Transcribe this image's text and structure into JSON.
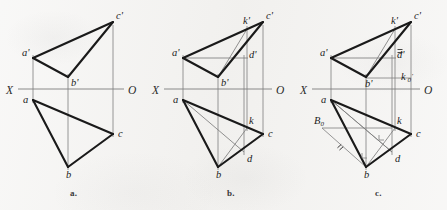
{
  "figure": {
    "background_color": "#f2f1ef",
    "ink_color": "#1a1a1a",
    "thin_color": "#7d7d7d"
  },
  "panels": [
    {
      "id": "a",
      "caption": "a.",
      "caption_x": 70,
      "caption_y": 192,
      "axis": {
        "x_label": "X",
        "o_label": "O",
        "x_label_pos": [
          6,
          94
        ],
        "o_label_pos": [
          128,
          94
        ],
        "line": [
          18,
          89,
          124,
          89
        ]
      },
      "points": [
        {
          "name": "a'",
          "x": 33,
          "y": 58,
          "label_dx": -11,
          "label_dy": -2
        },
        {
          "name": "b'",
          "x": 68,
          "y": 77,
          "label_dx": 3,
          "label_dy": 9
        },
        {
          "name": "c'",
          "x": 113,
          "y": 22,
          "label_dx": 3,
          "label_dy": -3
        },
        {
          "name": "a",
          "x": 33,
          "y": 100,
          "label_dx": -10,
          "label_dy": 3
        },
        {
          "name": "b",
          "x": 68,
          "y": 167,
          "label_dx": -2,
          "label_dy": 11
        },
        {
          "name": "c",
          "x": 113,
          "y": 134,
          "label_dx": 5,
          "label_dy": 3
        }
      ],
      "thick_edges": [
        [
          "a'",
          "b'"
        ],
        [
          "b'",
          "c'"
        ],
        [
          "c'",
          "a'"
        ],
        [
          "a",
          "b"
        ],
        [
          "b",
          "c"
        ],
        [
          "c",
          "a"
        ]
      ],
      "projection_lines": [
        [
          33,
          55,
          33,
          103
        ],
        [
          68,
          74,
          68,
          170
        ],
        [
          113,
          25,
          113,
          137
        ]
      ],
      "thin_edges": [],
      "extras": []
    },
    {
      "id": "b",
      "caption": "b.",
      "caption_x": 227,
      "caption_y": 192,
      "axis": {
        "x_label": "X",
        "o_label": "O",
        "x_label_pos": [
          152,
          94
        ],
        "o_label_pos": [
          276,
          94
        ],
        "line": [
          164,
          89,
          272,
          89
        ]
      },
      "points": [
        {
          "name": "a'",
          "x": 183,
          "y": 58,
          "label_dx": -11,
          "label_dy": -2
        },
        {
          "name": "b'",
          "x": 218,
          "y": 77,
          "label_dx": 3,
          "label_dy": 9
        },
        {
          "name": "c'",
          "x": 263,
          "y": 22,
          "label_dx": 3,
          "label_dy": -3
        },
        {
          "name": "k'",
          "x": 247,
          "y": 29,
          "label_dx": -4,
          "label_dy": -5
        },
        {
          "name": "d'",
          "x": 248,
          "y": 58,
          "label_dx": 1,
          "label_dy": 0
        },
        {
          "name": "a",
          "x": 183,
          "y": 100,
          "label_dx": -10,
          "label_dy": 3
        },
        {
          "name": "b",
          "x": 218,
          "y": 167,
          "label_dx": -2,
          "label_dy": 11
        },
        {
          "name": "c",
          "x": 263,
          "y": 134,
          "label_dx": 5,
          "label_dy": 3
        },
        {
          "name": "k",
          "x": 247,
          "y": 128,
          "label_dx": 2,
          "label_dy": -4
        },
        {
          "name": "d",
          "x": 244,
          "y": 152,
          "label_dx": 3,
          "label_dy": 10
        }
      ],
      "thick_edges": [
        [
          "a'",
          "b'"
        ],
        [
          "b'",
          "c'"
        ],
        [
          "c'",
          "a'"
        ],
        [
          "a",
          "b"
        ],
        [
          "b",
          "c"
        ],
        [
          "c",
          "a"
        ]
      ],
      "thin_edges": [
        [
          "a'",
          "d'"
        ],
        [
          "b'",
          "k'"
        ],
        [
          "a",
          "d"
        ],
        [
          "b",
          "k"
        ]
      ],
      "projection_lines": [
        [
          183,
          55,
          183,
          103
        ],
        [
          218,
          74,
          218,
          170
        ],
        [
          263,
          25,
          263,
          137
        ],
        [
          247,
          26,
          247,
          131
        ],
        [
          244,
          55,
          244,
          155
        ]
      ],
      "extras": []
    },
    {
      "id": "c",
      "caption": "c.",
      "caption_x": 375,
      "caption_y": 192,
      "axis": {
        "x_label": "X",
        "o_label": "O",
        "x_label_pos": [
          300,
          94
        ],
        "o_label_pos": [
          424,
          94
        ],
        "line": [
          312,
          89,
          420,
          89
        ]
      },
      "points": [
        {
          "name": "a'",
          "x": 331,
          "y": 58,
          "label_dx": -11,
          "label_dy": -2
        },
        {
          "name": "b'",
          "x": 366,
          "y": 77,
          "label_dx": -1,
          "label_dy": 10
        },
        {
          "name": "c'",
          "x": 411,
          "y": 22,
          "label_dx": 3,
          "label_dy": -3
        },
        {
          "name": "k'",
          "x": 395,
          "y": 29,
          "label_dx": -4,
          "label_dy": -5
        },
        {
          "name": "d'",
          "x": 396,
          "y": 58,
          "label_dx": 1,
          "label_dy": 0
        },
        {
          "name": "a",
          "x": 331,
          "y": 100,
          "label_dx": -10,
          "label_dy": 3
        },
        {
          "name": "b",
          "x": 366,
          "y": 167,
          "label_dx": -2,
          "label_dy": 11
        },
        {
          "name": "c",
          "x": 411,
          "y": 134,
          "label_dx": 5,
          "label_dy": 3
        },
        {
          "name": "k",
          "x": 395,
          "y": 128,
          "label_dx": 2,
          "label_dy": -4
        },
        {
          "name": "d",
          "x": 392,
          "y": 152,
          "label_dx": 3,
          "label_dy": 10
        }
      ],
      "thick_edges": [
        [
          "a'",
          "b'"
        ],
        [
          "b'",
          "c'"
        ],
        [
          "c'",
          "a'"
        ],
        [
          "a",
          "b"
        ],
        [
          "b",
          "c"
        ],
        [
          "c",
          "a"
        ]
      ],
      "thin_edges": [
        [
          "a'",
          "d'"
        ],
        [
          "b'",
          "k'"
        ],
        [
          "a",
          "d"
        ],
        [
          "b",
          "k"
        ]
      ],
      "projection_lines": [
        [
          331,
          55,
          331,
          103
        ],
        [
          366,
          74,
          366,
          170
        ],
        [
          411,
          25,
          411,
          137
        ],
        [
          395,
          26,
          395,
          131
        ],
        [
          392,
          55,
          392,
          155
        ]
      ],
      "extras": [
        {
          "kind": "label",
          "name": "k0-prime",
          "text": "k",
          "sub": "0",
          "prime": true,
          "x": 401,
          "y": 80
        },
        {
          "kind": "label",
          "name": "b0",
          "text": "B",
          "sub": "0",
          "prime": false,
          "x": 314,
          "y": 124
        },
        {
          "kind": "line",
          "name": "k0-horizontal",
          "coords": [
            366,
            78,
            411,
            78
          ]
        },
        {
          "kind": "line",
          "name": "b0-horizontal",
          "coords": [
            322,
            128,
            392,
            128
          ]
        },
        {
          "kind": "line",
          "name": "b0-to-b",
          "coords": [
            322,
            128,
            366,
            167
          ]
        },
        {
          "kind": "line",
          "name": "a-to-d-extend",
          "coords": [
            331,
            100,
            392,
            152
          ]
        },
        {
          "kind": "tick",
          "name": "tick-d-prime",
          "x": 400,
          "y": 52,
          "angle": 0
        },
        {
          "kind": "tick",
          "name": "tick-b0-segment",
          "x": 341,
          "y": 148,
          "angle": -42
        },
        {
          "kind": "right-angle",
          "name": "right-angle-d",
          "x": 379,
          "y": 140
        },
        {
          "kind": "right-angle",
          "name": "right-angle-b",
          "x": 362,
          "y": 158
        }
      ]
    }
  ]
}
